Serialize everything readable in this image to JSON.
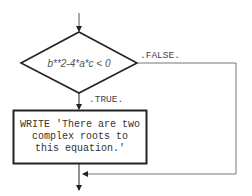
{
  "diagram": {
    "type": "flowchart",
    "decision": {
      "condition": "b**2-4*a*c < 0",
      "true_label": ".TRUE.",
      "false_label": ".FALSE."
    },
    "process": {
      "lines": [
        "WRITE 'There are two",
        "complex roots to",
        "this equation.'"
      ]
    },
    "colors": {
      "stroke": "#222222",
      "branch_line": "#777777",
      "background": "#ffffff"
    }
  }
}
